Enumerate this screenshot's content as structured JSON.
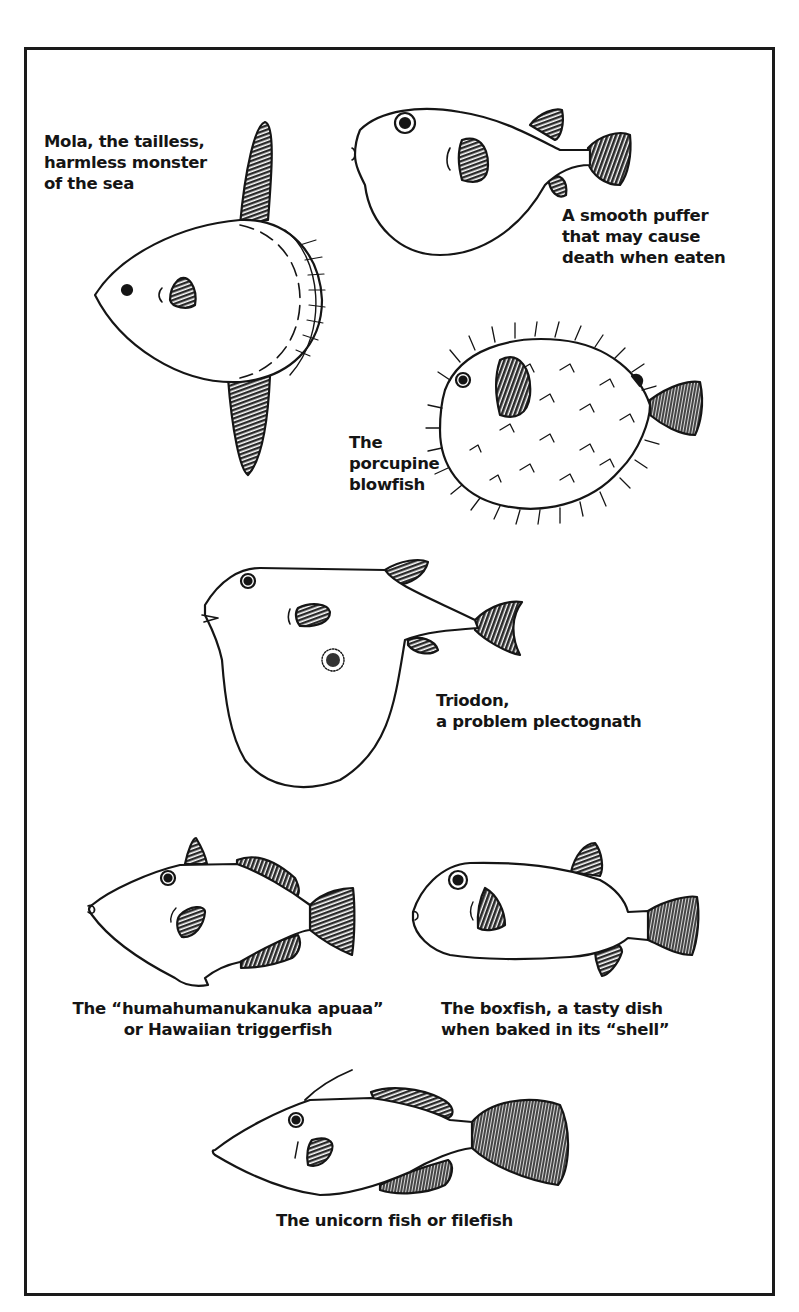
{
  "figure": {
    "captions": {
      "mola": [
        "Mola, the tailless,",
        "harmless monster",
        "of the sea"
      ],
      "smooth_puffer": [
        "A smooth puffer",
        "that may cause",
        "death when eaten"
      ],
      "porcupine": [
        "The",
        "porcupine",
        "blowfish"
      ],
      "triodon": [
        "Triodon,",
        "a problem plectognath"
      ],
      "triggerfish": [
        "The “humahumanukanuka apuaa”",
        "or Hawaiian triggerfish"
      ],
      "boxfish": [
        "The boxfish, a tasty dish",
        "when baked in its “shell”"
      ],
      "filefish": [
        "The unicorn fish or filefish"
      ]
    },
    "colors": {
      "ink": "#151515",
      "paper": "#ffffff",
      "hatch": "#333333"
    }
  }
}
